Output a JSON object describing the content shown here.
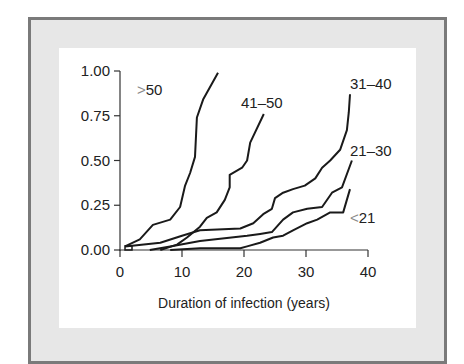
{
  "chart_data": {
    "type": "line",
    "title": "",
    "xlabel": "Duration of infection (years)",
    "ylabel": "",
    "xlim": [
      0,
      40
    ],
    "ylim": [
      0,
      1.0
    ],
    "xticks": [
      0,
      10,
      20,
      30,
      40
    ],
    "xtick_labels": [
      "0",
      "10",
      "20",
      "30",
      "40"
    ],
    "yticks": [
      0,
      0.25,
      0.5,
      0.75,
      1.0
    ],
    "ytick_labels": [
      "0.00",
      "0.25",
      "0.50",
      "0.75",
      "1.00"
    ],
    "grid": false,
    "legend": "inline labels at curve ends",
    "series": [
      {
        "name": ">50",
        "label_symbol": ">",
        "label_text": "50",
        "x": [
          0.8,
          3.2,
          5.3,
          8.1,
          9.7,
          10.5,
          11.3,
          12.1,
          12.4,
          13.4,
          15.8
        ],
        "y": [
          0.02,
          0.06,
          0.14,
          0.17,
          0.24,
          0.36,
          0.43,
          0.52,
          0.74,
          0.84,
          0.99
        ]
      },
      {
        "name": "41–50",
        "label_symbol": "",
        "label_text": "41–50",
        "x": [
          6.5,
          9.2,
          10.8,
          12.9,
          14.0,
          15.6,
          16.9,
          17.7,
          17.7,
          19.7,
          20.5,
          21.0,
          23.2
        ],
        "y": [
          0.0,
          0.03,
          0.07,
          0.13,
          0.18,
          0.21,
          0.28,
          0.35,
          0.42,
          0.46,
          0.5,
          0.6,
          0.76
        ]
      },
      {
        "name": "31–40",
        "label_symbol": "",
        "label_text": "31–40",
        "x": [
          0.8,
          6.5,
          10.0,
          12.9,
          19.4,
          21.5,
          23.1,
          24.5,
          25.0,
          26.3,
          27.9,
          29.8,
          31.5,
          32.6,
          33.9,
          35.5,
          36.6,
          36.9,
          37.1
        ],
        "y": [
          0.02,
          0.04,
          0.08,
          0.11,
          0.12,
          0.15,
          0.2,
          0.23,
          0.29,
          0.32,
          0.34,
          0.36,
          0.4,
          0.46,
          0.5,
          0.56,
          0.67,
          0.77,
          0.87
        ]
      },
      {
        "name": "21–30",
        "label_symbol": "",
        "label_text": "21–30",
        "x": [
          4.8,
          8.1,
          12.9,
          20.5,
          22.6,
          24.5,
          26.3,
          27.9,
          30.2,
          32.6,
          34.2,
          35.8,
          37.4
        ],
        "y": [
          0.0,
          0.02,
          0.05,
          0.08,
          0.09,
          0.1,
          0.17,
          0.21,
          0.23,
          0.24,
          0.32,
          0.35,
          0.5
        ]
      },
      {
        "name": "<21",
        "label_symbol": "<",
        "label_text": "21",
        "x": [
          8.1,
          12.9,
          19.4,
          20.5,
          22.6,
          24.7,
          26.3,
          27.9,
          30.2,
          31.8,
          33.9,
          36.0,
          37.1
        ],
        "y": [
          0.0,
          0.01,
          0.01,
          0.02,
          0.04,
          0.07,
          0.08,
          0.11,
          0.15,
          0.17,
          0.21,
          0.21,
          0.34
        ]
      }
    ]
  },
  "colors": {
    "frame_border": "#7a7a7a",
    "mat": "#e7e7e7",
    "panel": "#ffffff",
    "line": "#1a1a1a",
    "symbol": "#8a8a8a"
  }
}
